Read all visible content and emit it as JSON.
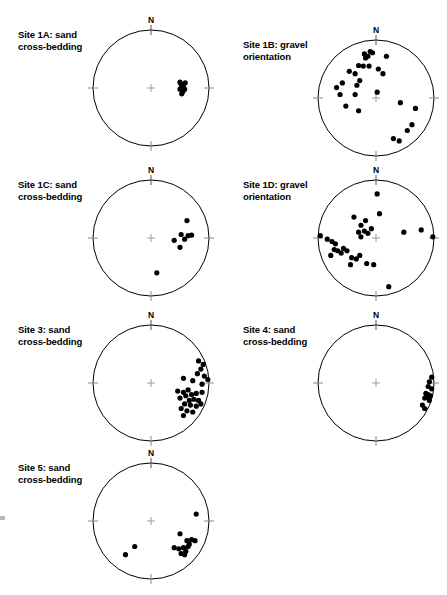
{
  "figure": {
    "type": "stereonet-grid",
    "columns": 2,
    "background": "#ffffff",
    "point_color": "#000000",
    "circle_color": "#000000",
    "tick_color": "#8a8a8a",
    "north_label": "N"
  },
  "chart_data": {
    "type": "scatter",
    "projection": "stereonet",
    "title": "",
    "xlabel": "",
    "ylabel": "",
    "grid": false,
    "legend": null,
    "note": "Each panel is a circular stereonet (lower-hemisphere equal-area projection). Point coordinates are given as fractions of the net radius from center: x positive = East, y positive = North. Radius 1.0 = primitive circle.",
    "panels": [
      {
        "id": "1A",
        "caption_line1": "Site 1A: sand",
        "caption_line2": "cross-bedding",
        "site": "Site 1A",
        "measurement": "sand cross-bedding",
        "n_points": 8,
        "center_px": [
          151,
          88
        ],
        "radius_px": 58,
        "points": [
          [
            0.52,
            0.06
          ],
          [
            0.56,
            0.02
          ],
          [
            0.5,
            -0.02
          ],
          [
            0.55,
            -0.06
          ],
          [
            0.59,
            0.09
          ],
          [
            0.53,
            -0.1
          ],
          [
            0.58,
            -0.02
          ],
          [
            0.5,
            0.1
          ]
        ]
      },
      {
        "id": "1B",
        "caption_line1": "Site 1B: gravel",
        "caption_line2": "orientation",
        "site": "Site 1B",
        "measurement": "gravel orientation",
        "n_points": 27,
        "center_px": [
          376,
          98
        ],
        "radius_px": 58,
        "points": [
          [
            -0.1,
            0.8
          ],
          [
            -0.06,
            0.78
          ],
          [
            -0.14,
            0.72
          ],
          [
            -0.18,
            0.69
          ],
          [
            -0.2,
            0.76
          ],
          [
            0.18,
            0.72
          ],
          [
            -0.3,
            0.56
          ],
          [
            -0.22,
            0.55
          ],
          [
            -0.12,
            0.55
          ],
          [
            -0.46,
            0.46
          ],
          [
            -0.36,
            0.42
          ],
          [
            0.04,
            0.5
          ],
          [
            0.12,
            0.42
          ],
          [
            -0.28,
            0.3
          ],
          [
            -0.33,
            0.22
          ],
          [
            -0.58,
            0.26
          ],
          [
            -0.68,
            0.18
          ],
          [
            -0.62,
            0.06
          ],
          [
            -0.36,
            0.06
          ],
          [
            0.02,
            0.1
          ],
          [
            -0.52,
            -0.14
          ],
          [
            -0.3,
            -0.22
          ],
          [
            0.42,
            -0.08
          ],
          [
            0.68,
            -0.18
          ],
          [
            0.54,
            -0.56
          ],
          [
            0.62,
            -0.46
          ],
          [
            0.3,
            -0.7
          ],
          [
            0.4,
            -0.74
          ]
        ]
      },
      {
        "id": "1C",
        "caption_line1": "Site 1C: sand",
        "caption_line2": "cross-bedding",
        "site": "Site 1C",
        "measurement": "sand cross-bedding",
        "n_points": 8,
        "center_px": [
          151,
          238
        ],
        "radius_px": 58,
        "points": [
          [
            0.62,
            0.3
          ],
          [
            0.52,
            0.06
          ],
          [
            0.64,
            0.04
          ],
          [
            0.7,
            0.05
          ],
          [
            0.4,
            -0.04
          ],
          [
            0.5,
            -0.16
          ],
          [
            0.58,
            -0.02
          ],
          [
            0.1,
            -0.6
          ]
        ]
      },
      {
        "id": "1D",
        "caption_line1": "Site 1D: gravel",
        "caption_line2": "orientation",
        "site": "Site 1D",
        "measurement": "gravel orientation",
        "n_points": 30,
        "center_px": [
          376,
          238
        ],
        "radius_px": 58,
        "points": [
          [
            0.02,
            0.76
          ],
          [
            0.06,
            0.42
          ],
          [
            -0.38,
            0.36
          ],
          [
            -0.26,
            0.22
          ],
          [
            -0.18,
            0.3
          ],
          [
            -0.2,
            0.12
          ],
          [
            -0.14,
            0.08
          ],
          [
            -0.3,
            0.1
          ],
          [
            -0.26,
            0.02
          ],
          [
            -0.08,
            0.16
          ],
          [
            0.48,
            0.1
          ],
          [
            0.78,
            0.14
          ],
          [
            0.98,
            0.02
          ],
          [
            -0.96,
            0.04
          ],
          [
            -0.84,
            -0.02
          ],
          [
            -0.76,
            -0.06
          ],
          [
            -0.7,
            -0.1
          ],
          [
            -0.72,
            -0.2
          ],
          [
            -0.66,
            -0.22
          ],
          [
            -0.6,
            -0.26
          ],
          [
            -0.78,
            -0.3
          ],
          [
            -0.5,
            -0.22
          ],
          [
            -0.42,
            -0.34
          ],
          [
            -0.34,
            -0.36
          ],
          [
            -0.28,
            -0.3
          ],
          [
            -0.44,
            -0.46
          ],
          [
            -0.16,
            -0.44
          ],
          [
            -0.04,
            -0.46
          ],
          [
            0.22,
            -0.84
          ],
          [
            -0.56,
            -0.18
          ]
        ]
      },
      {
        "id": "3",
        "caption_line1": "Site 3: sand",
        "caption_line2": "cross-bedding",
        "site": "Site 3",
        "measurement": "sand cross-bedding",
        "n_points": 28,
        "center_px": [
          151,
          383
        ],
        "radius_px": 58,
        "points": [
          [
            0.82,
            0.38
          ],
          [
            0.9,
            0.32
          ],
          [
            0.86,
            0.24
          ],
          [
            0.8,
            0.16
          ],
          [
            0.92,
            0.12
          ],
          [
            0.98,
            0.06
          ],
          [
            0.56,
            0.08
          ],
          [
            0.72,
            0.04
          ],
          [
            0.88,
            -0.02
          ],
          [
            0.46,
            -0.14
          ],
          [
            0.56,
            -0.16
          ],
          [
            0.64,
            -0.12
          ],
          [
            0.6,
            -0.22
          ],
          [
            0.7,
            -0.2
          ],
          [
            0.78,
            -0.18
          ],
          [
            0.88,
            -0.16
          ],
          [
            0.5,
            -0.26
          ],
          [
            0.66,
            -0.3
          ],
          [
            0.74,
            -0.28
          ],
          [
            0.82,
            -0.3
          ],
          [
            0.58,
            -0.36
          ],
          [
            0.68,
            -0.38
          ],
          [
            0.78,
            -0.4
          ],
          [
            0.86,
            -0.36
          ],
          [
            0.52,
            -0.44
          ],
          [
            0.62,
            -0.48
          ],
          [
            0.72,
            -0.5
          ],
          [
            0.56,
            -0.56
          ]
        ]
      },
      {
        "id": "4",
        "caption_line1": "Site 4: sand",
        "caption_line2": "cross-bedding",
        "site": "Site 4",
        "measurement": "sand cross-bedding",
        "n_points": 12,
        "center_px": [
          376,
          383
        ],
        "radius_px": 58,
        "points": [
          [
            0.96,
            0.1
          ],
          [
            0.92,
            0.02
          ],
          [
            0.9,
            -0.06
          ],
          [
            0.96,
            -0.1
          ],
          [
            0.86,
            -0.18
          ],
          [
            0.9,
            -0.2
          ],
          [
            0.94,
            -0.22
          ],
          [
            0.88,
            -0.24
          ],
          [
            0.84,
            -0.26
          ],
          [
            0.92,
            -0.3
          ],
          [
            0.8,
            -0.38
          ],
          [
            0.84,
            -0.44
          ]
        ]
      },
      {
        "id": "5",
        "caption_line1": "Site 5: sand",
        "caption_line2": "cross-bedding",
        "site": "Site 5",
        "measurement": "sand cross-bedding",
        "n_points": 15,
        "center_px": [
          151,
          521
        ],
        "radius_px": 58,
        "points": [
          [
            0.78,
            0.12
          ],
          [
            0.5,
            -0.22
          ],
          [
            0.62,
            -0.34
          ],
          [
            0.7,
            -0.32
          ],
          [
            0.76,
            -0.34
          ],
          [
            0.66,
            -0.4
          ],
          [
            0.4,
            -0.46
          ],
          [
            0.48,
            -0.48
          ],
          [
            0.56,
            -0.46
          ],
          [
            0.6,
            -0.52
          ],
          [
            0.58,
            -0.58
          ],
          [
            0.52,
            -0.56
          ],
          [
            -0.28,
            -0.44
          ],
          [
            -0.44,
            -0.58
          ],
          [
            0.64,
            -0.44
          ]
        ]
      }
    ]
  }
}
